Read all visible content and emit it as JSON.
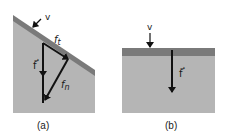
{
  "figure": {
    "colors": {
      "background": "#ffffff",
      "block_fill": "#b5b5b5",
      "surface_band": "#7a7a7a",
      "arrow": "#111111"
    },
    "panel_a": {
      "caption": "(a)",
      "description": "inclined surface with force decomposition",
      "labels": {
        "velocity": "v",
        "force": "f",
        "force_tangential": "f",
        "force_tangential_sub": "t",
        "force_normal": "f",
        "force_normal_sub": "n"
      }
    },
    "panel_b": {
      "caption": "(b)",
      "description": "horizontal surface with normal force",
      "labels": {
        "velocity": "v",
        "force": "f"
      }
    }
  }
}
